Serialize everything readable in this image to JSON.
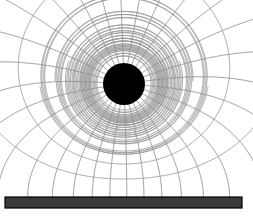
{
  "figure": {
    "caption": "",
    "width": 253,
    "height": 216,
    "background_color": "#ffffff"
  },
  "colors": {
    "field_line": "#8e8e8e",
    "equipotential_line": "#9a9a9a",
    "conductor": "#000000",
    "ground_bar_fill": "#3a3a3a",
    "ground_bar_stroke": "#000000",
    "background": "#ffffff"
  },
  "conductor": {
    "label": "charged sphere",
    "shape": "circle",
    "center_x": 124,
    "center_y": 84,
    "radius": 21,
    "fill": "#000000"
  },
  "ground_plane": {
    "label": "grounded plane",
    "x": 5,
    "y": 197,
    "width": 237,
    "height": 11,
    "fill": "#3a3a3a",
    "stroke": "#000000"
  },
  "chart_data": {
    "type": "line",
    "xlabel": "",
    "ylabel": "",
    "xlim": [
      0,
      253
    ],
    "ylim": [
      0,
      216
    ],
    "grid": false,
    "legend": null,
    "annotations": [],
    "source_charge": {
      "x": 124,
      "y": 84,
      "sign": "+",
      "strength": 1
    },
    "image_charge": {
      "x": 124,
      "y": 310,
      "sign": "-",
      "strength": 1
    },
    "ground_level_y": 197,
    "disc_radius": 21,
    "field_line_angles_deg": [
      4,
      16,
      28,
      40,
      52,
      64,
      76,
      88,
      100,
      112,
      124,
      136,
      148,
      160,
      172,
      184,
      196,
      208,
      220,
      232,
      244,
      256,
      268,
      280,
      292,
      304,
      316,
      328,
      340,
      352
    ],
    "equipotential_radii": [
      26,
      32,
      39,
      47,
      56,
      67,
      80,
      95,
      113,
      134,
      159,
      189
    ],
    "series": [
      {
        "name": "field lines",
        "count": 30,
        "style": "solid",
        "color": "#8e8e8e"
      },
      {
        "name": "equipotentials",
        "count": 12,
        "style": "solid",
        "color": "#9a9a9a"
      }
    ]
  }
}
